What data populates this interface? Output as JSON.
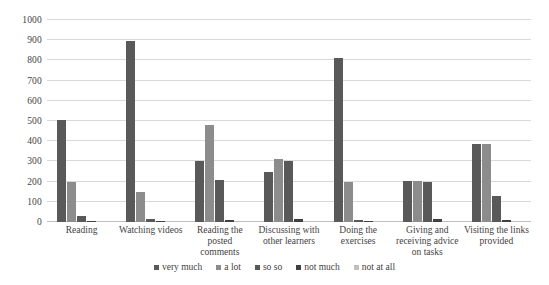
{
  "chart_data": {
    "type": "bar",
    "title": "",
    "xlabel": "",
    "ylabel": "",
    "ylim": [
      0,
      1000
    ],
    "ytick_values": [
      0,
      100,
      200,
      300,
      400,
      500,
      600,
      700,
      800,
      900,
      1000
    ],
    "ytick_labels": [
      "0",
      "100",
      "200",
      "300",
      "400",
      "500",
      "600",
      "700",
      "800",
      "900",
      "1000"
    ],
    "grid": true,
    "legend_position": "bottom",
    "categories": [
      "Reading",
      "Watching videos",
      "Reading the posted comments",
      "Discussing with other learners",
      "Doing the exercises",
      "Giving and receiving advice on tasks",
      "Visiting the links provided"
    ],
    "series": [
      {
        "name": "very much",
        "color": "#595959",
        "values": [
          505,
          895,
          300,
          250,
          810,
          205,
          385
        ]
      },
      {
        "name": "a lot",
        "color": "#8c8c8c",
        "values": [
          200,
          150,
          480,
          310,
          200,
          205,
          385
        ]
      },
      {
        "name": "so so",
        "color": "#595959",
        "values": [
          30,
          15,
          210,
          300,
          10,
          200,
          130
        ]
      },
      {
        "name": "not much",
        "color": "#404040",
        "values": [
          5,
          5,
          10,
          15,
          5,
          15,
          10
        ]
      },
      {
        "name": "not at all",
        "color": "#bfbfbf",
        "values": [
          3,
          3,
          4,
          4,
          3,
          4,
          4
        ]
      }
    ]
  },
  "colors": {
    "gridline": "#d9d9d9",
    "baseline": "#bfbfbf",
    "text": "#3f3f3f",
    "background": "#ffffff"
  }
}
